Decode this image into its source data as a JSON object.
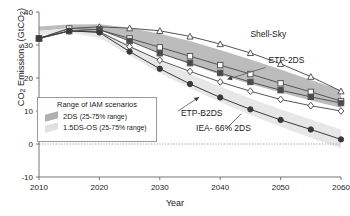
{
  "chart_data": {
    "type": "line",
    "title": "",
    "xlabel": "Year",
    "ylabel": "CO2 Emissions  (GtCO2)",
    "ylabel_main": "CO",
    "ylabel_sub1": "2",
    "ylabel_mid": " Emissions  (GtCO",
    "ylabel_sub2": "2",
    "ylabel_end": ")",
    "xlim": [
      2010,
      2060
    ],
    "ylim": [
      -10,
      40
    ],
    "xticks": [
      2010,
      2020,
      2030,
      2040,
      2050,
      2060
    ],
    "xtick_labels": [
      "2010",
      "2020",
      "2030",
      "2040",
      "2050",
      "2060"
    ],
    "yticks": [
      -10,
      0,
      10,
      20,
      30,
      40
    ],
    "ytick_labels": [
      "-10",
      "0",
      "10",
      "20",
      "30",
      "40"
    ],
    "grid": false,
    "zero_line": true,
    "x": [
      2010,
      2015,
      2020,
      2025,
      2030,
      2035,
      2040,
      2045,
      2050,
      2055,
      2060
    ],
    "series": [
      {
        "name": "Shell-Sky",
        "marker": "triangle-open",
        "color": "#555555",
        "values": [
          32.0,
          35.0,
          35.5,
          35.1,
          34.3,
          32.6,
          30.3,
          27.6,
          24.3,
          20.4,
          16.0
        ]
      },
      {
        "name": "ETP-2DS",
        "marker": "square-open",
        "color": "#555555",
        "values": [
          32.0,
          35.0,
          34.6,
          32.0,
          29.3,
          26.6,
          23.9,
          21.2,
          18.4,
          15.8,
          13.0
        ]
      },
      {
        "name": "ETP-2DS-lower",
        "marker": "square-half",
        "color": "#555555",
        "values": [
          32.0,
          34.2,
          34.7,
          31.2,
          27.5,
          24.5,
          21.5,
          18.8,
          16.3,
          14.3,
          12.4
        ]
      },
      {
        "name": "ETP-B2DS",
        "marker": "diamond-open",
        "color": "#555555",
        "values": [
          32.0,
          34.2,
          34.0,
          29.5,
          25.4,
          22.0,
          18.8,
          16.0,
          13.5,
          11.6,
          10.0
        ]
      },
      {
        "name": "IEA- 66% 2DS",
        "marker": "circle-filled",
        "color": "#3a3a3a",
        "values": [
          32.0,
          34.3,
          33.8,
          28.0,
          22.8,
          18.2,
          14.1,
          10.5,
          7.3,
          4.4,
          1.4
        ]
      }
    ],
    "bands": [
      {
        "name": "2DS (25-75% range)",
        "fill": "#b8b8b8",
        "upper": [
          35.6,
          36.2,
          36.3,
          35.2,
          33.4,
          31.2,
          28.5,
          25.6,
          22.6,
          19.4,
          16.3
        ],
        "lower": [
          34.3,
          35.0,
          34.5,
          31.3,
          27.6,
          24.2,
          21.0,
          18.2,
          15.6,
          13.2,
          11.0
        ]
      },
      {
        "name": "1.5DS-OS (25-75% range)",
        "fill": "#e4e4e4",
        "upper": [
          34.2,
          35.2,
          34.4,
          30.0,
          25.4,
          21.2,
          17.4,
          13.8,
          10.5,
          7.4,
          4.4
        ],
        "lower": [
          33.0,
          33.8,
          32.2,
          26.8,
          21.5,
          16.9,
          12.7,
          8.8,
          5.2,
          1.9,
          -1.4
        ]
      }
    ],
    "annotations": [
      {
        "text": "Shell-Sky",
        "x": 2045,
        "y": 32.5
      },
      {
        "text": "ETP-2DS",
        "x": 2048,
        "y": 24.5
      },
      {
        "text": "ETP-B2DS",
        "x": 2033.5,
        "y": 8.5
      },
      {
        "text": "IEA- 66% 2DS",
        "x": 2036,
        "y": 4.0
      }
    ],
    "legend": {
      "title": "Range of IAM scenarios",
      "position": "inside-lower-left",
      "entries": [
        {
          "label": "2DS ",
          "range": "(25-75% range)",
          "fill": "#b0b0b0"
        },
        {
          "label": "1.5DS-OS ",
          "range": "(25-75% range)",
          "fill": "#e0e0e0"
        }
      ]
    }
  }
}
